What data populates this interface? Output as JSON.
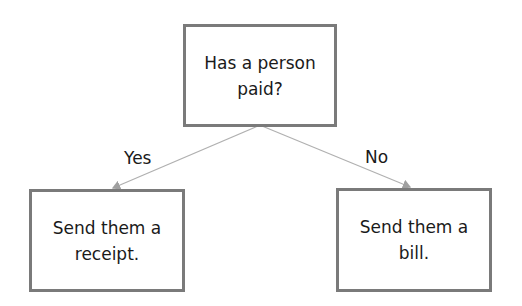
{
  "diagram": {
    "nodes": [
      {
        "id": "question",
        "text": "Has a person paid?"
      },
      {
        "id": "yes_action",
        "text": "Send them a receipt."
      },
      {
        "id": "no_action",
        "text": "Send them a bill."
      }
    ],
    "edges": [
      {
        "from": "question",
        "to": "yes_action",
        "label": "Yes"
      },
      {
        "from": "question",
        "to": "no_action",
        "label": "No"
      }
    ],
    "colors": {
      "box_border": "#7a7a7a",
      "edge": "#b0b0b0",
      "text": "#1a1a1a"
    }
  }
}
